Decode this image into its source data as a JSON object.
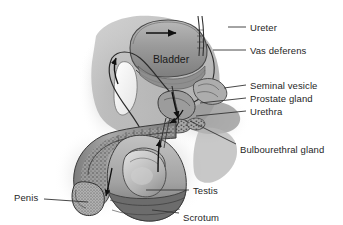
{
  "figure": {
    "style": "grayscale pencil/halftone anatomical illustration",
    "background_color": "#ffffff",
    "label_text_color": "#262626",
    "leader_line_color": "#333333",
    "arrow_color": "#111111"
  },
  "interior_labels": [
    {
      "name": "bladder",
      "text": "Bladder",
      "x": 153,
      "y": 59
    }
  ],
  "labels": [
    {
      "name": "ureter",
      "text": "Ureter",
      "x": 250,
      "y": 23,
      "leader": {
        "x1": 228,
        "y1": 27,
        "x2": 246,
        "y2": 27
      }
    },
    {
      "name": "vas-deferens",
      "text": "Vas deferens",
      "x": 250,
      "y": 46,
      "leader": {
        "x1": 213,
        "y1": 50,
        "x2": 246,
        "y2": 50
      }
    },
    {
      "name": "seminal-vesicle",
      "text": "Seminal vesicle",
      "x": 250,
      "y": 81,
      "leader": {
        "x1": 224,
        "y1": 88,
        "x2": 246,
        "y2": 85
      }
    },
    {
      "name": "prostate-gland",
      "text": "Prostate gland",
      "x": 250,
      "y": 94,
      "leader": {
        "x1": 200,
        "y1": 103,
        "x2": 246,
        "y2": 98
      }
    },
    {
      "name": "urethra",
      "text": "Urethra",
      "x": 250,
      "y": 107,
      "leader": {
        "x1": 196,
        "y1": 116,
        "x2": 246,
        "y2": 111
      }
    },
    {
      "name": "bulbourethral-gland",
      "text": "Bulbourethral gland",
      "x": 240,
      "y": 145,
      "leader": {
        "x1": 190,
        "y1": 121,
        "x2": 236,
        "y2": 144
      }
    },
    {
      "name": "testis",
      "text": "Testis",
      "x": 193,
      "y": 186,
      "leader": {
        "x1": 146,
        "y1": 190,
        "x2": 189,
        "y2": 190
      }
    },
    {
      "name": "scrotum",
      "text": "Scrotum",
      "x": 183,
      "y": 213,
      "leader": {
        "x1": 152,
        "y1": 210,
        "x2": 179,
        "y2": 213
      }
    },
    {
      "name": "penis",
      "text": "Penis",
      "x": 14,
      "y": 193,
      "leader": {
        "x1": 44,
        "y1": 199,
        "x2": 88,
        "y2": 202
      }
    }
  ],
  "flow_arrows": [
    {
      "name": "bladder-top-arrow",
      "direction": "right"
    },
    {
      "name": "vas-deferens-up-arrow",
      "direction": "up"
    },
    {
      "name": "ejaculatory-down-arrow",
      "direction": "down"
    },
    {
      "name": "urethra-down-arrow",
      "direction": "down-left"
    },
    {
      "name": "testis-exit-arrow",
      "direction": "up"
    }
  ]
}
